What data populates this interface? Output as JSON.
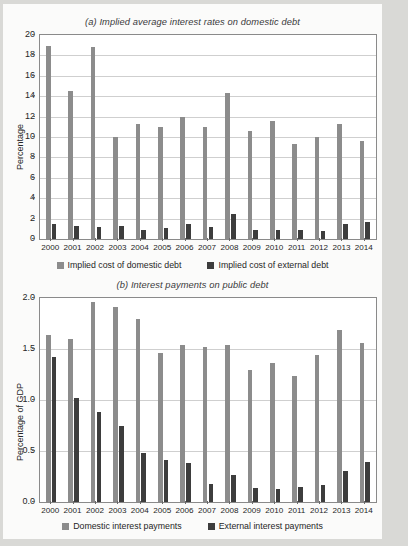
{
  "page": {
    "background_color": "#d9d9d6",
    "sheet_color": "#fbfbfa"
  },
  "colors": {
    "domestic_series": "#8c8c8c",
    "external_series": "#3d3d3d",
    "axis": "#8a8a8a",
    "grid": "#cfcfcf",
    "text": "#262626"
  },
  "chart_data": [
    {
      "id": "panel-a",
      "type": "bar",
      "title": "(a) Implied average interest rates on domestic debt",
      "xlabel": "",
      "ylabel": "Percentage",
      "ylim": [
        0,
        20
      ],
      "yticks": [
        "0",
        "2",
        "4",
        "6",
        "8",
        "10",
        "12",
        "14",
        "16",
        "18",
        "20"
      ],
      "ytick_values": [
        0,
        2,
        4,
        6,
        8,
        10,
        12,
        14,
        16,
        18,
        20
      ],
      "grid": true,
      "legend_position": "bottom",
      "categories": [
        "2000",
        "2001",
        "2002",
        "2003",
        "2004",
        "2005",
        "2006",
        "2007",
        "2008",
        "2009",
        "2010",
        "2011",
        "2012",
        "2013",
        "2014"
      ],
      "series": [
        {
          "name": "Implied cost of domestic debt",
          "color": "#8c8c8c",
          "values": [
            18.9,
            14.5,
            18.85,
            10.0,
            11.25,
            11.0,
            11.95,
            10.95,
            14.3,
            10.55,
            11.6,
            9.3,
            10.05,
            11.25,
            9.6
          ]
        },
        {
          "name": "Implied cost of external debt",
          "color": "#3d3d3d",
          "values": [
            1.5,
            1.3,
            1.2,
            1.25,
            0.9,
            1.05,
            1.45,
            1.15,
            2.5,
            0.85,
            0.9,
            0.9,
            0.8,
            1.5,
            1.7
          ]
        }
      ]
    },
    {
      "id": "panel-b",
      "type": "bar",
      "title": "(b) Interest payments on public debt",
      "xlabel": "",
      "ylabel": "Percentage of GDP",
      "ylim": [
        0,
        2.0
      ],
      "yticks": [
        "0.0",
        "0.5",
        "1.0",
        "1.5",
        "2.0"
      ],
      "ytick_values": [
        0,
        0.5,
        1.0,
        1.5,
        2.0
      ],
      "grid": true,
      "legend_position": "bottom",
      "categories": [
        "2000",
        "2001",
        "2002",
        "2003",
        "2004",
        "2005",
        "2006",
        "2007",
        "2008",
        "2009",
        "2010",
        "2011",
        "2012",
        "2013",
        "2014"
      ],
      "series": [
        {
          "name": "Domestic interest payments",
          "color": "#8c8c8c",
          "values": [
            1.64,
            1.6,
            1.96,
            1.91,
            1.79,
            1.46,
            1.54,
            1.52,
            1.54,
            1.29,
            1.36,
            1.24,
            1.44,
            1.69,
            1.56
          ]
        },
        {
          "name": "External interest payments",
          "color": "#3d3d3d",
          "values": [
            1.42,
            1.02,
            0.88,
            0.75,
            0.48,
            0.41,
            0.38,
            0.18,
            0.26,
            0.14,
            0.13,
            0.15,
            0.17,
            0.3,
            0.39
          ]
        }
      ]
    }
  ]
}
